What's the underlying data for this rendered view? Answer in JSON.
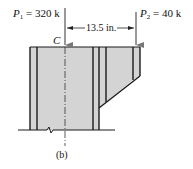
{
  "figure": {
    "label": "(b)",
    "load1": {
      "symbol": "P",
      "subscript": "1",
      "value": " = 320 k"
    },
    "load2": {
      "symbol": "P",
      "subscript": "2",
      "value": " = 40 k"
    },
    "centroid_label": "C",
    "dimension": "13.5 in."
  },
  "colors": {
    "fill": "#d4d4d4",
    "line": "#1a1a1a"
  }
}
